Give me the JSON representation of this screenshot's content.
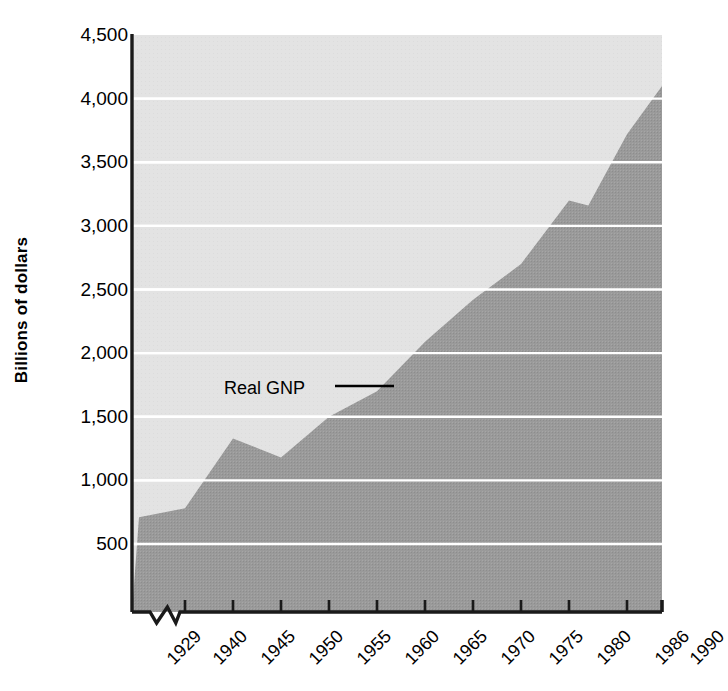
{
  "chart_data": {
    "type": "area",
    "title": "",
    "xlabel": "",
    "ylabel": "Billions of dollars",
    "series_name": "Real GNP",
    "x_tick_labels": [
      "1929",
      "1940",
      "1945",
      "1950",
      "1955",
      "1960",
      "1965",
      "1970",
      "1975",
      "1980",
      "1986",
      "1990"
    ],
    "y_tick_labels": [
      "500",
      "1,000",
      "1,500",
      "2,000",
      "2,500",
      "3,000",
      "3,500",
      "4,000",
      "4,500"
    ],
    "y_tick_values": [
      500,
      1000,
      1500,
      2000,
      2500,
      3000,
      3500,
      4000,
      4500
    ],
    "ylim": [
      0,
      4500
    ],
    "grid": true,
    "axis_break_between": [
      "1929",
      "1940"
    ],
    "legend_position": "inline-annotation",
    "annotation": "Real GNP",
    "x": [
      1929,
      1940,
      1945,
      1950,
      1955,
      1960,
      1965,
      1970,
      1975,
      1980,
      1982,
      1986,
      1990
    ],
    "values": [
      710,
      780,
      1330,
      1180,
      1500,
      1700,
      2090,
      2420,
      2700,
      3200,
      3160,
      3720,
      4100
    ],
    "colors": {
      "plot_background": "#e3e3e3",
      "area_fill": "#989898",
      "gridline": "#ffffff",
      "axis": "#1a1a1a",
      "text": "#000000"
    }
  },
  "axis_titles": {
    "y": "Billions of dollars"
  },
  "annotations": {
    "real_gnp": "Real GNP"
  }
}
